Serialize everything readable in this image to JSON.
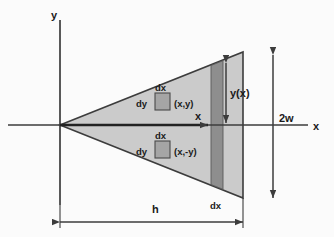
{
  "diagram": {
    "axes": {
      "y_axis_label": "y",
      "x_axis_label": "x",
      "x_local_label": "x"
    },
    "labels": {
      "height_label": "h",
      "width_label": "2w",
      "profile_label": "y(x)",
      "strip_label": "dx",
      "upper_element": {
        "dx": "dx",
        "dy": "dy",
        "point": "(x,y)"
      },
      "lower_element": {
        "dx": "dx",
        "dy": "dy",
        "point": "(x,-y)"
      }
    },
    "colors": {
      "triangle_fill": "#cbcbcb",
      "strip_fill": "#8e8e8e",
      "element_fill": "#a5a5a5",
      "stroke": "#3c3c3c",
      "background": "#fbfbfb"
    },
    "geometry": {
      "apex": [
        60,
        125
      ],
      "top_right": [
        243,
        52
      ],
      "bottom_right": [
        243,
        198
      ],
      "strip_left": 211,
      "strip_right": 223,
      "h_extent": [
        60,
        243
      ],
      "two_w_extent": [
        52,
        198
      ]
    }
  }
}
